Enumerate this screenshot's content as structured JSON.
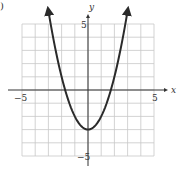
{
  "figure": {
    "part_label": ")"
  },
  "chart_data": {
    "type": "line",
    "title": "",
    "function": "y = x^2 - 3",
    "xlabel": "x",
    "ylabel": "y",
    "xlim": [
      -5,
      5
    ],
    "ylim": [
      -5,
      5
    ],
    "grid": true,
    "x_tick_labels": [
      {
        "value": -5,
        "label": "−5"
      },
      {
        "value": 5,
        "label": "5"
      }
    ],
    "y_tick_labels": [
      {
        "value": 5,
        "label": "5"
      },
      {
        "value": -5,
        "label": "−5"
      }
    ],
    "series": [
      {
        "name": "parabola",
        "color": "#2a2a2a",
        "arrows_at_ends": true,
        "x": [
          -3,
          -2.5,
          -2,
          -1.5,
          -1,
          -0.5,
          0,
          0.5,
          1,
          1.5,
          2,
          2.5,
          3
        ],
        "y": [
          6,
          3.25,
          1,
          -0.75,
          -2,
          -2.75,
          -3,
          -2.75,
          -2,
          -0.75,
          1,
          3.25,
          6
        ]
      }
    ],
    "annotations": [
      {
        "text": "vertex",
        "x": 0,
        "y": -3
      },
      {
        "text": "x-intercepts",
        "x": [
          -1.73,
          1.73
        ]
      }
    ]
  },
  "colors": {
    "grid": "#c8c8c8",
    "axis": "#333333",
    "curve": "#2a2a2a",
    "background": "#ffffff"
  }
}
